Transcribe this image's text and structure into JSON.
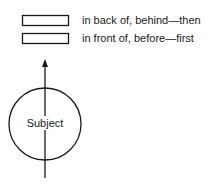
{
  "diagram": {
    "labels": [
      {
        "text": "in back of, behind—then",
        "box_y": 15
      },
      {
        "text": "in front of, before—first",
        "box_y": 33
      }
    ],
    "subject": {
      "text": "Subject"
    },
    "colors": {
      "stroke": "#1a1a1a",
      "background": "#ffffff"
    }
  }
}
